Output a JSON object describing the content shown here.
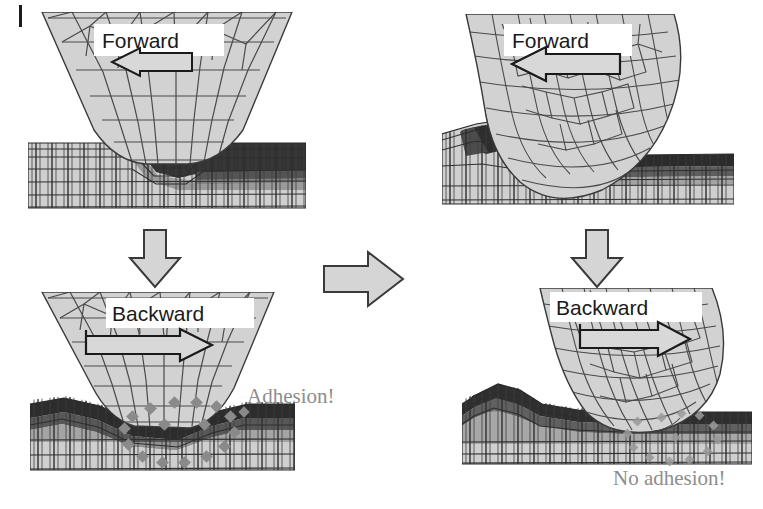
{
  "figure": {
    "margin_tick": "page-margin-rule"
  },
  "colors": {
    "tool_fill": "#d2d2d2",
    "tool_fill_light": "#dcdcdc",
    "mesh_line": "#4a4a4a",
    "substrate_fill": "#cfcfcf",
    "substrate_deformed_dark": "#2f2f2f",
    "substrate_mid": "#8f8f8f",
    "arrow_fill": "#d8d8d8",
    "arrow_outline": "#1a1a1a",
    "flow_arrow_fill": "#d5d5d5",
    "flow_arrow_outline": "#3a3a3a",
    "marker_gray": "#8a8a8a",
    "caption_gray": "#8d8d8d",
    "label_box": "#ffffff",
    "text_dark": "#1a1a1a"
  },
  "panels": [
    {
      "id": "top-left",
      "name": "sharp-tool-forward",
      "column": "left",
      "row": "top",
      "tool_shape": "sharp-wedge",
      "direction_label": "Forward",
      "arrow_direction": "left",
      "x": 28,
      "y": 12,
      "width": 278,
      "height": 200
    },
    {
      "id": "top-right",
      "name": "rounded-tool-forward",
      "column": "right",
      "row": "top",
      "tool_shape": "rounded-blade",
      "direction_label": "Forward",
      "arrow_direction": "left",
      "x": 442,
      "y": 14,
      "width": 292,
      "height": 200
    },
    {
      "id": "bottom-left",
      "name": "sharp-tool-backward",
      "column": "left",
      "row": "bottom",
      "tool_shape": "sharp-wedge",
      "direction_label": "Backward",
      "arrow_direction": "right",
      "x": 30,
      "y": 292,
      "width": 265,
      "height": 185
    },
    {
      "id": "bottom-right",
      "name": "rounded-tool-backward",
      "column": "right",
      "row": "bottom",
      "tool_shape": "rounded-blade",
      "direction_label": "Backward",
      "arrow_direction": "right",
      "x": 462,
      "y": 288,
      "width": 290,
      "height": 180
    }
  ],
  "flow_arrows": [
    {
      "id": "left-down",
      "name": "flow-arrow-down-left",
      "direction": "down",
      "x": 126,
      "y": 228,
      "width": 58,
      "height": 62
    },
    {
      "id": "right-down",
      "name": "flow-arrow-down-right",
      "direction": "down",
      "x": 568,
      "y": 228,
      "width": 58,
      "height": 62
    },
    {
      "id": "middle-right",
      "name": "flow-arrow-right-middle",
      "direction": "right",
      "x": 322,
      "y": 248,
      "width": 84,
      "height": 62
    }
  ],
  "captions": [
    {
      "id": "adhesion",
      "name": "adhesion-caption",
      "text": "Adhesion!",
      "panel": "bottom-left"
    },
    {
      "id": "no-adhesion",
      "name": "no-adhesion-caption",
      "text": "No adhesion!",
      "panel": "bottom-right"
    }
  ],
  "annotations": {
    "adhesion_marker_ring": {
      "name": "adhesion-marker-ring",
      "shape": "dashed-ellipse-of-diamonds",
      "marker_glyph": "diamond",
      "marker_count": 18,
      "color": "#8a8a8a"
    },
    "no_adhesion_marker_ring": {
      "name": "no-adhesion-marker-ring",
      "shape": "dashed-ellipse-of-diamonds",
      "marker_glyph": "diamond",
      "marker_count": 18,
      "color": "#9a9a9a"
    }
  },
  "direction_labels": {
    "forward": "Forward",
    "backward": "Backward"
  }
}
